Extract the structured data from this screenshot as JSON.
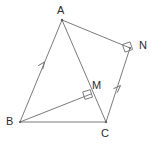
{
  "figure": {
    "background_color": "#ffffff",
    "stroke_color": "#7b7b7b",
    "label_color": "#2b2b2b",
    "points": {
      "A": {
        "label": "A",
        "x": 62,
        "y": 20
      },
      "B": {
        "label": "B",
        "x": 20,
        "y": 122
      },
      "C": {
        "label": "C",
        "x": 106,
        "y": 122
      },
      "M": {
        "label": "M",
        "x": 91,
        "y": 94
      },
      "N": {
        "label": "N",
        "x": 130,
        "y": 48
      }
    },
    "segments": [
      {
        "name": "segment-AB",
        "from": "A",
        "to": "B"
      },
      {
        "name": "segment-BC",
        "from": "B",
        "to": "C"
      },
      {
        "name": "segment-AC",
        "from": "A",
        "to": "C"
      },
      {
        "name": "segment-AN",
        "from": "A",
        "to": "N"
      },
      {
        "name": "segment-CN",
        "from": "C",
        "to": "N"
      },
      {
        "name": "segment-BM",
        "from": "B",
        "to": "M"
      }
    ],
    "right_angles": [
      {
        "name": "right-angle-at-M",
        "at": "M",
        "between": "BM and AC"
      },
      {
        "name": "right-angle-at-N",
        "at": "N",
        "between": "AN and CN"
      }
    ],
    "parallel_marks": [
      {
        "name": "parallel-mark-BA",
        "on": "segment-AB",
        "ticks": 1
      },
      {
        "name": "parallel-mark-CN",
        "on": "segment-CN",
        "ticks": 1
      }
    ]
  }
}
